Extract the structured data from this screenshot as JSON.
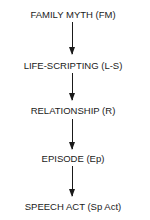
{
  "diagram": {
    "type": "vertical-flow",
    "nodes": [
      {
        "id": "FM",
        "label": "FAMILY MYTH (FM)"
      },
      {
        "id": "L-S",
        "label": "LIFE-SCRIPTING (L-S)"
      },
      {
        "id": "R",
        "label": "RELATIONSHIP (R)"
      },
      {
        "id": "Ep",
        "label": "EPISODE (Ep)"
      },
      {
        "id": "Sp Act",
        "label": "SPEECH ACT (Sp Act)"
      }
    ],
    "edges": [
      {
        "from": "FM",
        "to": "L-S"
      },
      {
        "from": "L-S",
        "to": "R"
      },
      {
        "from": "R",
        "to": "Ep"
      },
      {
        "from": "Ep",
        "to": "Sp Act"
      }
    ]
  }
}
